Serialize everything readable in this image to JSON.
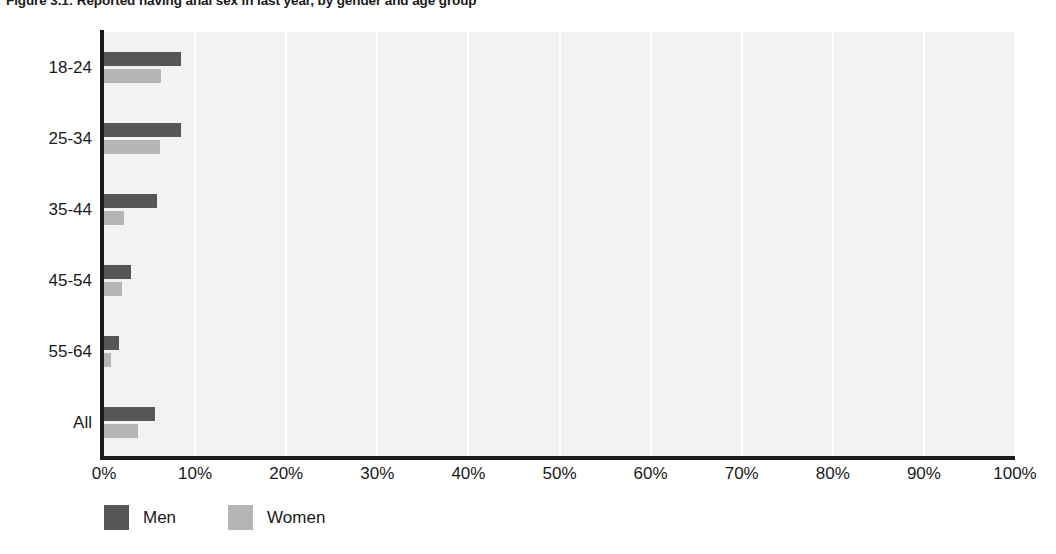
{
  "chart_data": {
    "type": "bar",
    "orientation": "horizontal",
    "title": "Figure 3.1: Reported having anal sex in last year, by gender and age group",
    "xlabel": "",
    "ylabel": "",
    "categories": [
      "18-24",
      "25-34",
      "35-44",
      "45-54",
      "55-64",
      "All"
    ],
    "series": [
      {
        "name": "Men",
        "color": "#565656",
        "values": [
          8.5,
          8.5,
          5.8,
          3.0,
          1.6,
          5.6
        ]
      },
      {
        "name": "Women",
        "color": "#b5b5b5",
        "values": [
          6.3,
          6.1,
          2.2,
          2.0,
          0.8,
          3.7
        ]
      }
    ],
    "xlim": [
      0,
      100
    ],
    "xticks": [
      0,
      10,
      20,
      30,
      40,
      50,
      60,
      70,
      80,
      90,
      100
    ],
    "xtick_labels": [
      "0%",
      "10%",
      "20%",
      "30%",
      "40%",
      "50%",
      "60%",
      "70%",
      "80%",
      "90%",
      "100%"
    ],
    "grid": "vertical",
    "grid_color": "#ffffff",
    "plot_background": "#f2f2f2",
    "legend_position": "bottom-left",
    "legend": [
      {
        "label": "Men",
        "color": "#565656"
      },
      {
        "label": "Women",
        "color": "#b5b5b5"
      }
    ]
  }
}
